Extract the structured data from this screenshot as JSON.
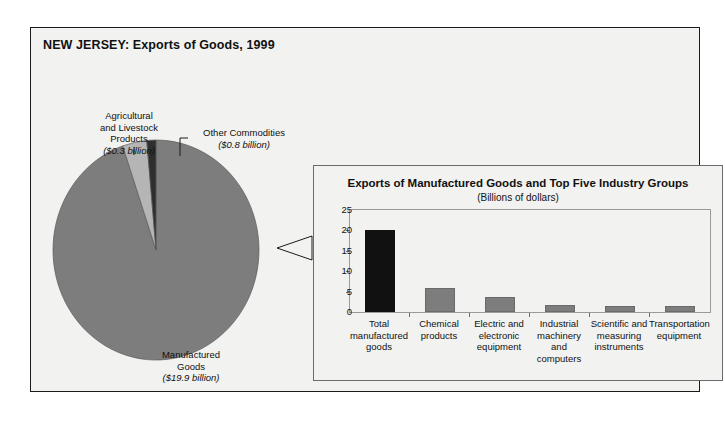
{
  "figure": {
    "title": "NEW JERSEY: Exports of Goods, 1999"
  },
  "pie": {
    "labels": {
      "agricultural": {
        "name_line1": "Agricultural",
        "name_line2": "and Livestock",
        "name_line3": "Products",
        "amount": "($0.3 billion)"
      },
      "other": {
        "name_line1": "Other Commodities",
        "amount": "($0.8 billion)"
      },
      "manufactured": {
        "name_line1": "Manufactured",
        "name_line2": "Goods",
        "amount": "($19.9 billion)"
      }
    }
  },
  "bar_panel": {
    "title": "Exports of Manufactured Goods and Top Five Industry Groups",
    "subtitle": "(Billions of dollars)"
  },
  "colors": {
    "manufactured_slice": "#7d7d7d",
    "other_slice": "#b5b5b5",
    "agricultural_slice": "#2e2e2e",
    "total_bar": "#111111",
    "industry_bar": "#7d7d7d",
    "frame": "#1a1a1a",
    "background": "#f2f2f0"
  },
  "chart_data": [
    {
      "type": "pie",
      "title": "NEW JERSEY: Exports of Goods, 1999",
      "unit": "Billions of dollars",
      "categories": [
        "Manufactured Goods",
        "Other Commodities",
        "Agricultural and Livestock Products"
      ],
      "values": [
        19.9,
        0.8,
        0.3
      ],
      "labels": [
        "($19.9 billion)",
        "($0.8 billion)",
        "($0.3 billion)"
      ],
      "colors": [
        "#7d7d7d",
        "#b5b5b5",
        "#2e2e2e"
      ],
      "start_angle_deg": 0,
      "direction": "clockwise",
      "legend": "callout-labels"
    },
    {
      "type": "bar",
      "title": "Exports of Manufactured Goods and Top Five Industry Groups",
      "subtitle": "(Billions of dollars)",
      "xlabel": "",
      "ylabel": "",
      "ylim": [
        0,
        25
      ],
      "yticks": [
        0,
        5,
        10,
        15,
        20,
        25
      ],
      "grid": false,
      "legend": "none",
      "categories": [
        "Total manufactured goods",
        "Chemical products",
        "Electric and electronic equipment",
        "Industrial machinery and computers",
        "Scientific and measuring instruments",
        "Transportation equipment"
      ],
      "category_lines": [
        [
          "Total",
          "manufactured",
          "goods"
        ],
        [
          "Chemical",
          "products"
        ],
        [
          "Electric and",
          "electronic",
          "equipment"
        ],
        [
          "Industrial",
          "machinery and",
          "computers"
        ],
        [
          "Scientific and",
          "measuring",
          "instruments"
        ],
        [
          "Transportation",
          "equipment"
        ]
      ],
      "values": [
        20.0,
        6.0,
        3.6,
        1.8,
        1.5,
        1.4
      ],
      "bar_colors": [
        "#111111",
        "#7d7d7d",
        "#7d7d7d",
        "#7d7d7d",
        "#7d7d7d",
        "#7d7d7d"
      ]
    }
  ]
}
